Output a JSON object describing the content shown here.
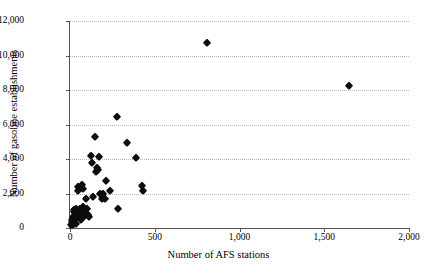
{
  "chart_data": {
    "type": "scatter",
    "title": "",
    "xlabel": "Number of AFS stations",
    "ylabel": "Number of gasoline establishments",
    "xlim": [
      0,
      2000
    ],
    "ylim": [
      0,
      12000
    ],
    "xticks": [
      0,
      500,
      1000,
      1500,
      2000
    ],
    "yticks": [
      0,
      2000,
      4000,
      6000,
      8000,
      10000,
      12000
    ],
    "xtick_labels": [
      "0",
      "500",
      "1,000",
      "1,500",
      "2,000"
    ],
    "ytick_labels": [
      "0",
      "2,000",
      "4,000",
      "6,000",
      "8,000",
      "10,000",
      "12,000"
    ],
    "grid": "horizontal-dotted",
    "legend": null,
    "marker": "diamond",
    "marker_color": "#0d0d0d",
    "series": [
      {
        "name": "states",
        "points": [
          [
            8,
            200
          ],
          [
            12,
            330
          ],
          [
            14,
            480
          ],
          [
            18,
            150
          ],
          [
            20,
            620
          ],
          [
            22,
            900
          ],
          [
            24,
            1020
          ],
          [
            26,
            380
          ],
          [
            30,
            700
          ],
          [
            34,
            250
          ],
          [
            38,
            1080
          ],
          [
            42,
            560
          ],
          [
            46,
            2370
          ],
          [
            50,
            2150
          ],
          [
            54,
            840
          ],
          [
            58,
            1130
          ],
          [
            62,
            660
          ],
          [
            66,
            480
          ],
          [
            70,
            2520
          ],
          [
            74,
            2240
          ],
          [
            78,
            1200
          ],
          [
            82,
            950
          ],
          [
            86,
            700
          ],
          [
            92,
            1660
          ],
          [
            98,
            1090
          ],
          [
            104,
            780
          ],
          [
            110,
            620
          ],
          [
            124,
            4160
          ],
          [
            128,
            3760
          ],
          [
            134,
            1800
          ],
          [
            150,
            5270
          ],
          [
            156,
            3260
          ],
          [
            162,
            3500
          ],
          [
            166,
            3380
          ],
          [
            172,
            4100
          ],
          [
            178,
            1980
          ],
          [
            186,
            1700
          ],
          [
            196,
            2000
          ],
          [
            206,
            1680
          ],
          [
            214,
            2740
          ],
          [
            236,
            2170
          ],
          [
            276,
            6430
          ],
          [
            282,
            1080
          ],
          [
            336,
            4920
          ],
          [
            388,
            4030
          ],
          [
            426,
            2440
          ],
          [
            430,
            2150
          ],
          [
            806,
            10740
          ],
          [
            1646,
            8240
          ]
        ]
      }
    ]
  }
}
